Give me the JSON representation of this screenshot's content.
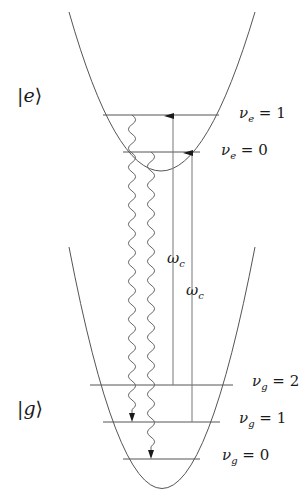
{
  "diagram": {
    "type": "energy-level-diagram",
    "states": {
      "excited": {
        "label": "|e⟩"
      },
      "ground": {
        "label": "|g⟩"
      }
    },
    "levels": {
      "ve1": {
        "label": "νₑ = 1"
      },
      "ve0": {
        "label": "νₑ = 0"
      },
      "vg2": {
        "label": "ν𝑔 = 2"
      },
      "vg1": {
        "label": "ν𝑔 = 1"
      },
      "vg0": {
        "label": "ν𝑔 = 0"
      }
    },
    "transitions": {
      "pump1": {
        "label": "ωc",
        "from": "vg2",
        "to": "ve1"
      },
      "pump2": {
        "label": "ωc",
        "from": "vg1",
        "to": "ve0"
      },
      "emission1": {
        "from": "ve1",
        "to": "vg1",
        "style": "wavy"
      },
      "emission2": {
        "from": "ve0",
        "to": "vg0",
        "style": "wavy"
      }
    },
    "colors": {
      "line": "#555555",
      "text": "#1a1a1a"
    }
  }
}
